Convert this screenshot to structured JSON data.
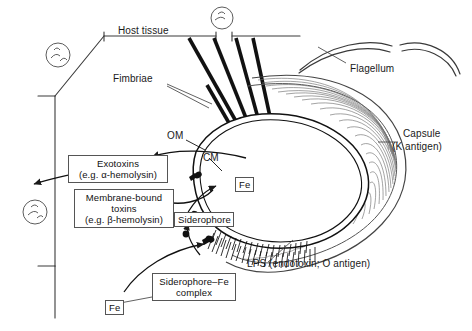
{
  "figure": {
    "style": "black and white line drawing",
    "ink_color": "#1a1a1a",
    "background_color": "#ffffff"
  },
  "labels": {
    "host_tissue": "Host tissue",
    "fimbriae": "Fimbriae",
    "om": "OM",
    "cm": "CM",
    "flagellum": "Flagellum",
    "capsule_line1": "Capsule",
    "capsule_line2": "(K antigen)",
    "lps": "LPS (endotoxin; O antigen)"
  },
  "boxes": {
    "exotoxins": {
      "line1": "Exotoxins",
      "line2": "(e.g. α-hemolysin)"
    },
    "membrane_bound_toxins": {
      "line1": "Membrane-bound",
      "line2": "toxins",
      "line3": "(e.g. β-hemolysin)"
    },
    "siderophore": {
      "line1": "Siderophore"
    },
    "siderophore_fe_complex": {
      "line1": "Siderophore–Fe",
      "line2": "complex"
    },
    "fe_uptake": {
      "line1": "Fe"
    },
    "fe_source": {
      "line1": "Fe"
    }
  },
  "structures": {
    "host_cells": "epithelial cells with nuclei",
    "nuclei_count": 3,
    "fimbriae_count": 5,
    "capsule": "fibrous outer layer",
    "lps_hatching": "dense hatched band along lower cell surface"
  }
}
